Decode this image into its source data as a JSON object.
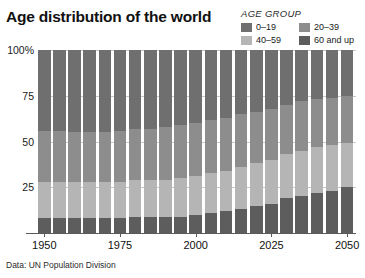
{
  "title": "Age distribution of the world",
  "source_note": "Data: UN Population Division",
  "legend": {
    "heading": "AGE GROUP",
    "items": [
      {
        "label": "0–19",
        "color": "#6f6f6f"
      },
      {
        "label": "20–39",
        "color": "#8d8d8d"
      },
      {
        "label": "40–59",
        "color": "#b5b5b5"
      },
      {
        "label": "60 and up",
        "color": "#5d5d5d"
      }
    ]
  },
  "chart_data": {
    "type": "bar",
    "stacked": true,
    "stacked_100pct": true,
    "title": "Age distribution of the world",
    "subtitle": "",
    "xlabel": "",
    "ylabel": "",
    "ylim": [
      0,
      100
    ],
    "grid": true,
    "legend_position": "top-right",
    "annotations": [
      "Data: UN Population Division"
    ],
    "axis": {
      "y_ticks": [
        0,
        25,
        50,
        75,
        100
      ],
      "y_tick_labels": [
        "",
        "25",
        "50",
        "75",
        "100%"
      ],
      "x_ticks": [
        1950,
        1975,
        2000,
        2025,
        2050
      ],
      "x_tick_labels": [
        "1950",
        "1975",
        "2000",
        "2025",
        "2050"
      ]
    },
    "categories": [
      "1950",
      "1955",
      "1960",
      "1965",
      "1970",
      "1975",
      "1980",
      "1985",
      "1990",
      "1995",
      "2000",
      "2005",
      "2010",
      "2015",
      "2020",
      "2025",
      "2030",
      "2035",
      "2040",
      "2045",
      "2050"
    ],
    "series": [
      {
        "name": "0–19",
        "color": "#6f6f6f",
        "values": [
          44,
          44,
          45,
          45,
          45,
          44,
          43,
          43,
          42,
          41,
          40,
          38,
          37,
          35,
          34,
          32,
          30,
          28,
          27,
          26,
          25
        ]
      },
      {
        "name": "20–39",
        "color": "#8d8d8d",
        "values": [
          28,
          28,
          27,
          27,
          27,
          28,
          28,
          28,
          29,
          29,
          29,
          29,
          29,
          29,
          28,
          28,
          27,
          27,
          26,
          26,
          26
        ]
      },
      {
        "name": "40–59",
        "color": "#b5b5b5",
        "values": [
          20,
          20,
          20,
          20,
          20,
          20,
          20,
          20,
          20,
          21,
          21,
          22,
          22,
          23,
          23,
          24,
          24,
          25,
          25,
          25,
          24
        ]
      },
      {
        "name": "60 and up",
        "color": "#5d5d5d",
        "values": [
          8,
          8,
          8,
          8,
          8,
          8,
          9,
          9,
          9,
          9,
          10,
          11,
          12,
          13,
          15,
          16,
          19,
          20,
          22,
          23,
          25
        ]
      }
    ]
  }
}
